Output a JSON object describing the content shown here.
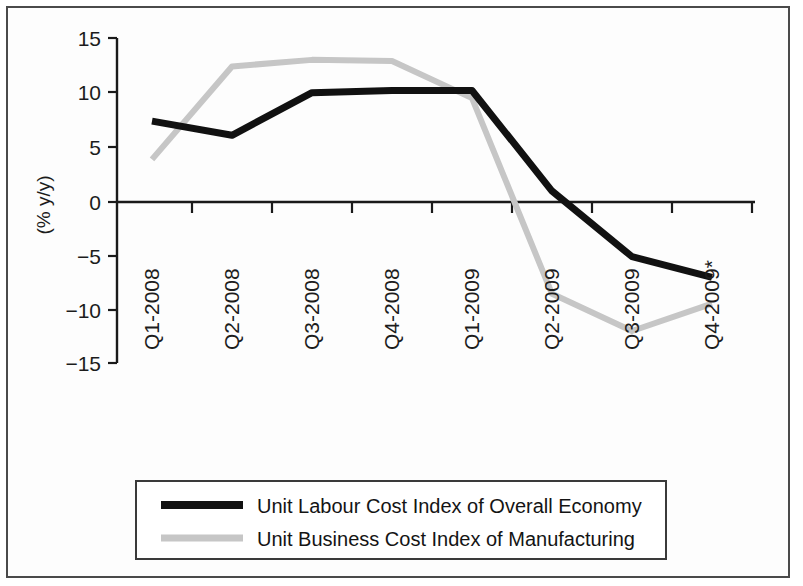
{
  "chart_data": {
    "type": "line",
    "title": "",
    "xlabel": "",
    "ylabel": "(% y/y)",
    "categories": [
      "Q1-2008",
      "Q2-2008",
      "Q3-2008",
      "Q4-2008",
      "Q1-2009",
      "Q2-2009",
      "Q3-2009",
      "Q4-2009*"
    ],
    "yticks": [
      "15",
      "10",
      "5",
      "0",
      "-5",
      "-10",
      "-15"
    ],
    "ytick_values": [
      15,
      10,
      5,
      0,
      -5,
      -10,
      -15
    ],
    "ylim": [
      -15,
      15
    ],
    "grid": false,
    "legend_position": "bottom",
    "series": [
      {
        "name": "Unit Labour Cost Index of Overall Economy",
        "color": "#111111",
        "width": 7,
        "values": [
          7.4,
          6.1,
          10.0,
          10.2,
          10.2,
          1.0,
          -5.0,
          -6.9
        ]
      },
      {
        "name": "Unit Business Cost Index of Manufacturing",
        "color": "#c6c6c6",
        "width": 6,
        "values": [
          3.9,
          12.4,
          13.0,
          12.9,
          9.5,
          -8.4,
          -11.8,
          -9.3
        ]
      }
    ]
  },
  "axis": {
    "y_title": "(% y/y)",
    "y_ticks": [
      "15",
      "10",
      "5",
      "0",
      "−5",
      "−10",
      "−15"
    ],
    "x_ticks": [
      "Q1-2008",
      "Q2-2008",
      "Q3-2008",
      "Q4-2008",
      "Q1-2009",
      "Q2-2009",
      "Q3-2009",
      "Q4-2009*"
    ]
  },
  "legend": {
    "items": [
      {
        "label": "Unit Labour Cost Index of Overall Economy",
        "color": "#111111"
      },
      {
        "label": "Unit Business Cost Index of Manufacturing",
        "color": "#c6c6c6"
      }
    ]
  }
}
